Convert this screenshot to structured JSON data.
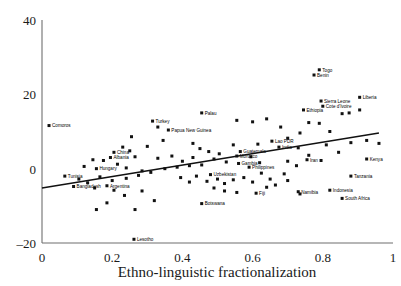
{
  "chart_data": {
    "type": "scatter",
    "title": "",
    "xlabel": "Ethno-linguistic fractionalization",
    "ylabel": "",
    "xlim": [
      0,
      1
    ],
    "ylim": [
      -20,
      40
    ],
    "xticks": [
      "0",
      "0.2",
      "0.4",
      "0.6",
      "0.8",
      "1"
    ],
    "xtick_values": [
      0,
      0.2,
      0.4,
      0.6,
      0.8,
      1
    ],
    "yticks": [
      "40",
      "20",
      "0",
      "–20"
    ],
    "ytick_values": [
      40,
      20,
      0,
      -20
    ],
    "grid": false,
    "legend": "none",
    "trendline": {
      "type": "linear",
      "x_start": 0.0,
      "y_start": -5.2,
      "x_end": 0.96,
      "y_end": 9.6
    },
    "labeled_points": [
      {
        "label": "Comoros",
        "x": 0.02,
        "y": 11.6
      },
      {
        "label": "Turkey",
        "x": 0.315,
        "y": 12.8
      },
      {
        "label": "Palau",
        "x": 0.455,
        "y": 15.0
      },
      {
        "label": "Papua New Guinea",
        "x": 0.36,
        "y": 10.4
      },
      {
        "label": "Togo",
        "x": 0.79,
        "y": 26.6
      },
      {
        "label": "Benin",
        "x": 0.775,
        "y": 25.2
      },
      {
        "label": "Liberia",
        "x": 0.905,
        "y": 19.2
      },
      {
        "label": "Sierra Leone",
        "x": 0.795,
        "y": 18.2
      },
      {
        "label": "Cote d'Ivoire",
        "x": 0.8,
        "y": 16.8
      },
      {
        "label": "Ethiopia",
        "x": 0.745,
        "y": 15.8
      },
      {
        "label": "Lao PDR",
        "x": 0.655,
        "y": 7.4
      },
      {
        "label": "India",
        "x": 0.675,
        "y": 5.8
      },
      {
        "label": "Guatemala",
        "x": 0.565,
        "y": 4.6
      },
      {
        "label": "Morocco",
        "x": 0.555,
        "y": 3.4
      },
      {
        "label": "Gambia",
        "x": 0.56,
        "y": 1.4
      },
      {
        "label": "Philippines",
        "x": 0.59,
        "y": 0.4
      },
      {
        "label": "Uzbekistan",
        "x": 0.48,
        "y": -1.6
      },
      {
        "label": "Iran",
        "x": 0.755,
        "y": 2.4
      },
      {
        "label": "Kenya",
        "x": 0.925,
        "y": 2.6
      },
      {
        "label": "Tanzania",
        "x": 0.88,
        "y": -2.0
      },
      {
        "label": "Indonesia",
        "x": 0.82,
        "y": -5.8
      },
      {
        "label": "Namibia",
        "x": 0.73,
        "y": -6.2
      },
      {
        "label": "South Africa",
        "x": 0.855,
        "y": -8.0
      },
      {
        "label": "Fiji",
        "x": 0.61,
        "y": -6.6
      },
      {
        "label": "Botswana",
        "x": 0.455,
        "y": -9.4
      },
      {
        "label": "China",
        "x": 0.205,
        "y": 4.4
      },
      {
        "label": "Albania",
        "x": 0.195,
        "y": 3.0
      },
      {
        "label": "Hungary",
        "x": 0.155,
        "y": 0.0
      },
      {
        "label": "Tunisia",
        "x": 0.065,
        "y": -2.0
      },
      {
        "label": "Bangladesh",
        "x": 0.09,
        "y": -4.8
      },
      {
        "label": "Argentina",
        "x": 0.185,
        "y": -4.6
      },
      {
        "label": "Lesotho",
        "x": 0.262,
        "y": -19.0
      }
    ],
    "unlabeled_points": [
      {
        "x": 0.255,
        "y": 8.6
      },
      {
        "x": 0.3,
        "y": 6.0
      },
      {
        "x": 0.345,
        "y": 7.6
      },
      {
        "x": 0.23,
        "y": 5.8
      },
      {
        "x": 0.265,
        "y": 3.2
      },
      {
        "x": 0.175,
        "y": 2.2
      },
      {
        "x": 0.215,
        "y": 1.2
      },
      {
        "x": 0.145,
        "y": 2.4
      },
      {
        "x": 0.12,
        "y": 0.6
      },
      {
        "x": 0.24,
        "y": 0.2
      },
      {
        "x": 0.285,
        "y": -0.6
      },
      {
        "x": 0.33,
        "y": 2.8
      },
      {
        "x": 0.37,
        "y": 3.4
      },
      {
        "x": 0.4,
        "y": 2.0
      },
      {
        "x": 0.43,
        "y": 3.0
      },
      {
        "x": 0.42,
        "y": 0.8
      },
      {
        "x": 0.455,
        "y": 1.0
      },
      {
        "x": 0.385,
        "y": 0.4
      },
      {
        "x": 0.35,
        "y": 0.0
      },
      {
        "x": 0.31,
        "y": -1.0
      },
      {
        "x": 0.275,
        "y": -1.8
      },
      {
        "x": 0.24,
        "y": -2.6
      },
      {
        "x": 0.2,
        "y": -3.2
      },
      {
        "x": 0.165,
        "y": -2.2
      },
      {
        "x": 0.13,
        "y": -3.8
      },
      {
        "x": 0.105,
        "y": -2.8
      },
      {
        "x": 0.15,
        "y": -5.2
      },
      {
        "x": 0.205,
        "y": -5.8
      },
      {
        "x": 0.235,
        "y": -7.2
      },
      {
        "x": 0.185,
        "y": -9.2
      },
      {
        "x": 0.155,
        "y": -11.0
      },
      {
        "x": 0.285,
        "y": -6.0
      },
      {
        "x": 0.32,
        "y": -8.6
      },
      {
        "x": 0.265,
        "y": -11.0
      },
      {
        "x": 0.395,
        "y": -2.4
      },
      {
        "x": 0.42,
        "y": -3.6
      },
      {
        "x": 0.44,
        "y": -2.0
      },
      {
        "x": 0.47,
        "y": -3.4
      },
      {
        "x": 0.5,
        "y": -2.8
      },
      {
        "x": 0.52,
        "y": -4.0
      },
      {
        "x": 0.545,
        "y": -3.0
      },
      {
        "x": 0.49,
        "y": -5.2
      },
      {
        "x": 0.52,
        "y": -6.0
      },
      {
        "x": 0.555,
        "y": -6.4
      },
      {
        "x": 0.575,
        "y": -2.4
      },
      {
        "x": 0.6,
        "y": -3.6
      },
      {
        "x": 0.625,
        "y": -1.2
      },
      {
        "x": 0.65,
        "y": -2.8
      },
      {
        "x": 0.64,
        "y": -5.0
      },
      {
        "x": 0.665,
        "y": -4.4
      },
      {
        "x": 0.69,
        "y": -1.4
      },
      {
        "x": 0.7,
        "y": 2.0
      },
      {
        "x": 0.725,
        "y": 0.8
      },
      {
        "x": 0.62,
        "y": 1.6
      },
      {
        "x": 0.595,
        "y": 3.2
      },
      {
        "x": 0.545,
        "y": 6.4
      },
      {
        "x": 0.505,
        "y": 4.0
      },
      {
        "x": 0.475,
        "y": 4.6
      },
      {
        "x": 0.45,
        "y": 5.4
      },
      {
        "x": 0.49,
        "y": 2.6
      },
      {
        "x": 0.525,
        "y": 1.8
      },
      {
        "x": 0.615,
        "y": 6.6
      },
      {
        "x": 0.68,
        "y": 11.2
      },
      {
        "x": 0.7,
        "y": 8.2
      },
      {
        "x": 0.735,
        "y": 9.6
      },
      {
        "x": 0.76,
        "y": 12.4
      },
      {
        "x": 0.79,
        "y": 12.2
      },
      {
        "x": 0.82,
        "y": 10.0
      },
      {
        "x": 0.855,
        "y": 14.8
      },
      {
        "x": 0.875,
        "y": 15.0
      },
      {
        "x": 0.905,
        "y": 15.8
      },
      {
        "x": 0.81,
        "y": 6.4
      },
      {
        "x": 0.845,
        "y": 4.4
      },
      {
        "x": 0.88,
        "y": 7.0
      },
      {
        "x": 0.925,
        "y": 7.6
      },
      {
        "x": 0.96,
        "y": 6.8
      },
      {
        "x": 0.73,
        "y": 5.6
      },
      {
        "x": 0.76,
        "y": 3.6
      },
      {
        "x": 0.795,
        "y": 2.2
      },
      {
        "x": 0.7,
        "y": -3.2
      },
      {
        "x": 0.735,
        "y": -6.8
      },
      {
        "x": 0.555,
        "y": 13.0
      },
      {
        "x": 0.6,
        "y": 12.6
      },
      {
        "x": 0.64,
        "y": 13.4
      },
      {
        "x": 0.33,
        "y": 11.2
      },
      {
        "x": 0.25,
        "y": 4.8
      },
      {
        "x": 0.43,
        "y": 6.8
      }
    ]
  }
}
